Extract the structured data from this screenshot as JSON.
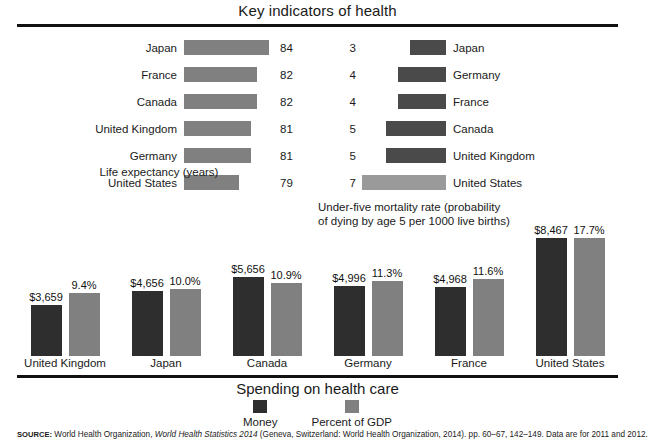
{
  "title": "Key indicators of health",
  "life_panel": {
    "caption": "Life expectancy (years)"
  },
  "mortality_panel": {
    "caption_line1": "Under-five mortality rate (probability",
    "caption_line2": "of dying by age 5 per 1000 live births)"
  },
  "spending_panel": {
    "title": "Spending on health care",
    "legend": [
      {
        "label": "Money",
        "color": "#2e2e2e"
      },
      {
        "label": "Percent of GDP",
        "color": "#808080"
      }
    ]
  },
  "source": {
    "tag": "SOURCE:",
    "text_before": " World Health Organization, ",
    "italic": "World Health Statistics 2014",
    "text_after": " (Geneva, Switzerland: World Health Organization, 2014). pp. 60–67, 142–149. Data are for 2011 and 2012."
  },
  "chart_data": [
    {
      "type": "bar",
      "title": "Life expectancy (years)",
      "orientation": "horizontal",
      "xlabel": "Life expectancy (years)",
      "ylabel": "",
      "grid": false,
      "legend": "none",
      "categories": [
        "Japan",
        "France",
        "Canada",
        "United Kingdom",
        "Germany",
        "United States"
      ],
      "values": [
        84,
        82,
        82,
        81,
        81,
        79
      ],
      "value_labels": [
        "84",
        "82",
        "82",
        "81",
        "81",
        "79"
      ],
      "bar_color": "#808080"
    },
    {
      "type": "bar",
      "title": "Under-five mortality rate (probability of dying by age 5 per 1000 live births)",
      "orientation": "horizontal-reversed",
      "xlabel": "Under-five mortality rate (probability of dying by age 5 per 1000 live births)",
      "ylabel": "",
      "grid": false,
      "legend": "none",
      "categories": [
        "Japan",
        "Germany",
        "France",
        "Canada",
        "United Kingdom",
        "United States"
      ],
      "values": [
        3,
        4,
        4,
        5,
        5,
        7
      ],
      "value_labels": [
        "3",
        "4",
        "4",
        "5",
        "5",
        "7"
      ],
      "bar_color": "#4a4a4a",
      "highlight_category": "United States",
      "highlight_color": "#9a9a9a"
    },
    {
      "type": "bar",
      "title": "Spending on health care",
      "orientation": "vertical-grouped",
      "xlabel": "",
      "ylabel": "",
      "grid": false,
      "legend": "bottom-center",
      "categories": [
        "United Kingdom",
        "Japan",
        "Canada",
        "Germany",
        "France",
        "United States"
      ],
      "series": [
        {
          "name": "Money",
          "color": "#2e2e2e",
          "values": [
            3659,
            4656,
            5656,
            4996,
            4968,
            8467
          ],
          "value_labels": [
            "$3,659",
            "$4,656",
            "$5,656",
            "$4,996",
            "$4,968",
            "$8,467"
          ]
        },
        {
          "name": "Percent of GDP",
          "color": "#808080",
          "values": [
            9.4,
            10.0,
            10.9,
            11.3,
            11.6,
            17.7
          ],
          "value_labels": [
            "9.4%",
            "10.0%",
            "10.9%",
            "11.3%",
            "11.6%",
            "17.7%"
          ]
        }
      ]
    }
  ]
}
